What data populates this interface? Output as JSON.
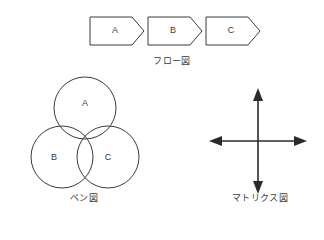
{
  "page": {
    "background_color": "#ffffff",
    "stroke_color": "#3a3a3a",
    "fill_color": "#ffffff",
    "text_color": "#3a3a3a"
  },
  "figures": {
    "flow": {
      "label": "フロー図",
      "type": "flow-chart",
      "steps": [
        {
          "label": "A",
          "x": 90,
          "y": 17,
          "width": 54,
          "height": 28
        },
        {
          "label": "B",
          "x": 148,
          "y": 17,
          "width": 54,
          "height": 28
        },
        {
          "label": "C",
          "x": 206,
          "y": 17,
          "width": 54,
          "height": 28
        }
      ],
      "notch": 12
    },
    "venn": {
      "label": "ベン図",
      "type": "venn-diagram",
      "circles": [
        {
          "label": "A",
          "cx": 85,
          "cy": 108,
          "r": 31,
          "label_dx": 0,
          "label_dy": -6
        },
        {
          "label": "B",
          "cx": 62,
          "cy": 157,
          "r": 31,
          "label_dx": -8,
          "label_dy": 3
        },
        {
          "label": "C",
          "cx": 108,
          "cy": 157,
          "r": 31,
          "label_dx": 8,
          "label_dy": 3
        }
      ]
    },
    "matrix": {
      "label": "マトリクス図",
      "type": "matrix-axes",
      "center_x": 258,
      "center_y": 141,
      "half_width": 49,
      "half_height": 53
    }
  }
}
